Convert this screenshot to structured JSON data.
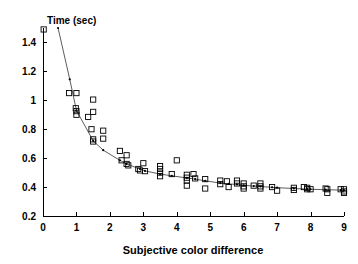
{
  "chart_data": {
    "type": "scatter",
    "title": "",
    "xlabel": "Subjective color difference",
    "ylabel": "Time (sec)",
    "xlim": [
      0,
      9
    ],
    "ylim": [
      0.2,
      1.5
    ],
    "grid": false,
    "legend": "none",
    "xticks": [
      "0",
      "1",
      "2",
      "3",
      "4",
      "5",
      "6",
      "7",
      "8",
      "9"
    ],
    "xtick_values": [
      0,
      1,
      2,
      3,
      4,
      5,
      6,
      7,
      8,
      9
    ],
    "yticks": [
      "0.2",
      "0.4",
      "0.6",
      "0.8",
      "1",
      "1.2",
      "1.4"
    ],
    "ytick_values": [
      0.2,
      0.4,
      0.6,
      0.8,
      1.0,
      1.2,
      1.4
    ],
    "marker": "open-square",
    "marker_color": "#000000",
    "line_color": "#333333",
    "series": [
      {
        "name": "observations",
        "marker": "open-square",
        "points": [
          [
            0.02,
            1.49
          ],
          [
            0.78,
            1.05
          ],
          [
            1.0,
            1.05
          ],
          [
            0.98,
            0.945
          ],
          [
            1.0,
            0.925
          ],
          [
            1.0,
            0.9
          ],
          [
            1.35,
            0.885
          ],
          [
            1.5,
            1.005
          ],
          [
            1.5,
            0.92
          ],
          [
            1.45,
            0.8
          ],
          [
            1.5,
            0.73
          ],
          [
            1.5,
            0.715
          ],
          [
            1.8,
            0.79
          ],
          [
            1.8,
            0.735
          ],
          [
            2.3,
            0.65
          ],
          [
            2.35,
            0.585
          ],
          [
            2.5,
            0.62
          ],
          [
            2.5,
            0.56
          ],
          [
            2.55,
            0.55
          ],
          [
            2.85,
            0.525
          ],
          [
            2.9,
            0.515
          ],
          [
            3.0,
            0.565
          ],
          [
            3.05,
            0.51
          ],
          [
            3.5,
            0.545
          ],
          [
            3.5,
            0.525
          ],
          [
            3.5,
            0.5
          ],
          [
            3.5,
            0.475
          ],
          [
            3.85,
            0.49
          ],
          [
            4.0,
            0.585
          ],
          [
            4.3,
            0.485
          ],
          [
            4.3,
            0.465
          ],
          [
            4.3,
            0.445
          ],
          [
            4.3,
            0.41
          ],
          [
            4.5,
            0.49
          ],
          [
            4.55,
            0.46
          ],
          [
            4.85,
            0.455
          ],
          [
            4.85,
            0.39
          ],
          [
            5.3,
            0.445
          ],
          [
            5.3,
            0.42
          ],
          [
            5.5,
            0.44
          ],
          [
            5.55,
            0.4
          ],
          [
            5.8,
            0.445
          ],
          [
            5.8,
            0.425
          ],
          [
            6.0,
            0.425
          ],
          [
            6.0,
            0.405
          ],
          [
            6.0,
            0.39
          ],
          [
            6.3,
            0.41
          ],
          [
            6.5,
            0.425
          ],
          [
            6.5,
            0.405
          ],
          [
            6.5,
            0.39
          ],
          [
            6.85,
            0.4
          ],
          [
            7.0,
            0.375
          ],
          [
            7.5,
            0.395
          ],
          [
            7.5,
            0.38
          ],
          [
            7.8,
            0.4
          ],
          [
            7.9,
            0.395
          ],
          [
            7.9,
            0.385
          ],
          [
            8.0,
            0.385
          ],
          [
            8.45,
            0.39
          ],
          [
            8.5,
            0.385
          ],
          [
            8.5,
            0.36
          ],
          [
            8.9,
            0.385
          ],
          [
            9.0,
            0.385
          ],
          [
            9.0,
            0.37
          ],
          [
            9.0,
            0.36
          ]
        ]
      },
      {
        "name": "fitted-curve",
        "marker": "small-dot",
        "points": [
          [
            0.45,
            1.5
          ],
          [
            0.8,
            1.145
          ],
          [
            1.0,
            0.93
          ],
          [
            1.5,
            0.72
          ],
          [
            1.8,
            0.655
          ],
          [
            2.3,
            0.585
          ],
          [
            2.5,
            0.56
          ],
          [
            2.9,
            0.525
          ],
          [
            3.05,
            0.512
          ],
          [
            3.5,
            0.49
          ],
          [
            3.85,
            0.478
          ],
          [
            4.3,
            0.463
          ],
          [
            4.55,
            0.455
          ],
          [
            4.85,
            0.443
          ],
          [
            5.3,
            0.428
          ],
          [
            5.55,
            0.422
          ],
          [
            5.8,
            0.418
          ],
          [
            6.0,
            0.412
          ],
          [
            6.3,
            0.407
          ],
          [
            6.5,
            0.404
          ],
          [
            6.85,
            0.398
          ],
          [
            7.0,
            0.396
          ],
          [
            7.5,
            0.39
          ],
          [
            7.9,
            0.386
          ],
          [
            8.0,
            0.385
          ],
          [
            8.45,
            0.382
          ],
          [
            8.9,
            0.379
          ],
          [
            9.0,
            0.378
          ]
        ]
      }
    ]
  }
}
